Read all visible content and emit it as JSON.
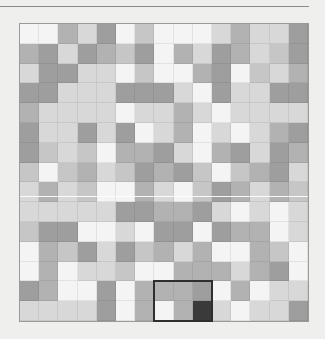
{
  "palette": {
    "W": "#f4f4f4",
    "L": "#d8d8d8",
    "LM": "#c6c6c6",
    "M": "#b2b2b2",
    "MD": "#9e9e9e",
    "D": "#3a3a3a"
  },
  "board": {
    "columns": 15,
    "rows": 15,
    "cells": [
      [
        "W",
        "W",
        "M",
        "L",
        "MD",
        "W",
        "LM",
        "W",
        "W",
        "W",
        "L",
        "M",
        "L",
        "L",
        "MD"
      ],
      [
        "M",
        "MD",
        "L",
        "MD",
        "M",
        "LM",
        "MD",
        "W",
        "M",
        "L",
        "MD",
        "M",
        "L",
        "LM",
        "MD"
      ],
      [
        "L",
        "MD",
        "MD",
        "L",
        "L",
        "W",
        "LM",
        "W",
        "W",
        "M",
        "MD",
        "W",
        "LM",
        "L",
        "M"
      ],
      [
        "MD",
        "MD",
        "L",
        "L",
        "L",
        "MD",
        "MD",
        "MD",
        "L",
        "W",
        "MD",
        "L",
        "L",
        "MD",
        "MD"
      ],
      [
        "M",
        "L",
        "L",
        "L",
        "L",
        "W",
        "L",
        "L",
        "M",
        "L",
        "W",
        "L",
        "L",
        "L",
        "L"
      ],
      [
        "MD",
        "L",
        "L",
        "MD",
        "L",
        "MD",
        "W",
        "L",
        "M",
        "W",
        "L",
        "W",
        "L",
        "M",
        "MD"
      ],
      [
        "MD",
        "LM",
        "L",
        "LM",
        "W",
        "M",
        "M",
        "MD",
        "L",
        "W",
        "M",
        "MD",
        "L",
        "MD",
        "M"
      ],
      [
        "LM",
        "W",
        "LM",
        "M",
        "L",
        "LM",
        "MD",
        "M",
        "MD",
        "LM",
        "W",
        "LM",
        "M",
        "MD",
        "L"
      ],
      [
        "L",
        "M",
        "L",
        "LM",
        "W",
        "W",
        "M",
        "L",
        "W",
        "LM",
        "MD",
        "M",
        "L",
        "M",
        "LM"
      ],
      [
        "L",
        "L",
        "L",
        "L",
        "L",
        "MD",
        "MD",
        "M",
        "M",
        "MD",
        "L",
        "W",
        "L",
        "W",
        "L"
      ],
      [
        "LM",
        "MD",
        "MD",
        "W",
        "W",
        "L",
        "W",
        "MD",
        "MD",
        "W",
        "MD",
        "M",
        "M",
        "W",
        "L"
      ],
      [
        "W",
        "M",
        "LM",
        "MD",
        "L",
        "MD",
        "LM",
        "M",
        "L",
        "M",
        "W",
        "W",
        "M",
        "LM",
        "W"
      ],
      [
        "W",
        "M",
        "W",
        "L",
        "L",
        "LM",
        "W",
        "W",
        "M",
        "M",
        "M",
        "L",
        "M",
        "MD",
        "W"
      ],
      [
        "MD",
        "M",
        "W",
        "W",
        "MD",
        "W",
        "M",
        "M",
        "M",
        "MD",
        "W",
        "M",
        "W",
        "L",
        "L"
      ],
      [
        "L",
        "L",
        "L",
        "L",
        "MD",
        "W",
        "M",
        "W",
        "M",
        "D",
        "L",
        "W",
        "L",
        "L",
        "MD"
      ]
    ]
  },
  "selection": {
    "col": 7,
    "row": 13,
    "width_cells": 3,
    "height_cells": 2,
    "border_color": "#2e2e2e"
  }
}
